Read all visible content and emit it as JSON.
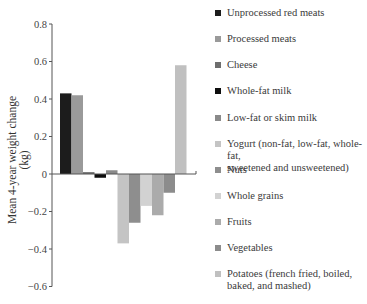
{
  "chart_data": {
    "type": "bar",
    "title": "",
    "xlabel": "",
    "ylabel": "Mean 4-year weight  change (kg)",
    "ylim": [
      -0.6,
      0.8
    ],
    "yticks": [
      0.8,
      0.6,
      0.4,
      0.2,
      0,
      -0.2,
      -0.4,
      -0.6
    ],
    "ytick_labels": [
      "0.8",
      "0.6",
      "0.4",
      "0.2",
      "0",
      "−0.2",
      "−0.4",
      "−0.6"
    ],
    "grid": false,
    "legend_position": "right",
    "categories": [
      "Unprocessed red meats",
      "Processed meats",
      "Cheese",
      "Whole-fat milk",
      "Low-fat or skim milk",
      "Yogurt (non-fat, low-fat, whole-fat, sweetened and unsweetened)",
      "Nuts",
      "Whole grains",
      "Fruits",
      "Vegetables",
      "Potatoes (french fried, boiled, baked, and mashed)"
    ],
    "values": [
      0.43,
      0.42,
      0.01,
      -0.02,
      0.02,
      -0.37,
      -0.26,
      -0.17,
      -0.22,
      -0.1,
      0.58
    ],
    "colors": [
      "#1c1c1c",
      "#9a9a9a",
      "#6e6e6e",
      "#0e0e0e",
      "#8a8a8a",
      "#c4c4c4",
      "#8e8e8e",
      "#d2d2d2",
      "#ababab",
      "#8c8c8c",
      "#c0c0c0"
    ]
  },
  "legend": {
    "items": [
      {
        "lines": [
          "Unprocessed red meats"
        ]
      },
      {
        "lines": [
          "Processed meats"
        ]
      },
      {
        "lines": [
          "Cheese"
        ]
      },
      {
        "lines": [
          "Whole-fat milk"
        ]
      },
      {
        "lines": [
          "Low-fat or skim milk"
        ]
      },
      {
        "lines": [
          "Yogurt (non-fat, low-fat, whole-fat,",
          "sweetened and unsweetened)"
        ]
      },
      {
        "lines": [
          "Nuts"
        ]
      },
      {
        "lines": [
          "Whole grains"
        ]
      },
      {
        "lines": [
          "Fruits"
        ]
      },
      {
        "lines": [
          "Vegetables"
        ]
      },
      {
        "lines": [
          "Potatoes (french fried, boiled,",
          "baked, and mashed)"
        ]
      }
    ]
  }
}
